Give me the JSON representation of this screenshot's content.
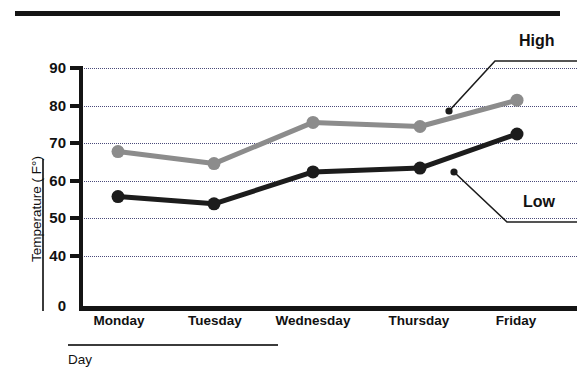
{
  "chart_data": {
    "type": "line",
    "title": "",
    "xlabel": "Day",
    "ylabel": "Temperature ( F°)",
    "categories": [
      "Monday",
      "Tuesday",
      "Wednesday",
      "Thursday",
      "Friday"
    ],
    "series": [
      {
        "name": "High",
        "color": "#8c8c8c",
        "values": [
          67.7,
          64.5,
          75.5,
          74.4,
          81.4
        ]
      },
      {
        "name": "Low",
        "color": "#1c1c1c",
        "values": [
          55.7,
          53.8,
          62.3,
          63.3,
          72.4
        ]
      }
    ],
    "ylim": [
      0,
      90
    ],
    "yticks": [
      0,
      40,
      50,
      60,
      70,
      80,
      90
    ],
    "ytick_labels": [
      "0",
      "40",
      "50",
      "60",
      "70",
      "80",
      "90"
    ],
    "y_axis_break": true,
    "grid": true,
    "gridlines_at": [
      40,
      50,
      60,
      70,
      80,
      90
    ],
    "grid_style": "dotted",
    "grid_color": "#4a4a7a",
    "legend_position": "inline-annotations",
    "annotations": [
      {
        "text": "High",
        "points_to_series": "High"
      },
      {
        "text": "Low",
        "points_to_series": "Low"
      }
    ]
  },
  "axes": {
    "y": {
      "label": "Temperature ( F°)",
      "ticks": [
        {
          "label": "90"
        },
        {
          "label": "80"
        },
        {
          "label": "70"
        },
        {
          "label": "60"
        },
        {
          "label": "50"
        },
        {
          "label": "40"
        },
        {
          "label": "0"
        }
      ]
    },
    "x": {
      "label": "Day",
      "ticks": [
        {
          "label": "Monday"
        },
        {
          "label": "Tuesday"
        },
        {
          "label": "Wednesday"
        },
        {
          "label": "Thursday"
        },
        {
          "label": "Friday"
        }
      ]
    }
  },
  "annotations": {
    "high_label": "High",
    "low_label": "Low"
  },
  "colors": {
    "high_series": "#8c8c8c",
    "low_series": "#1c1c1c",
    "grid": "#4a4a7a",
    "axis": "#141414",
    "background": "#ffffff"
  }
}
